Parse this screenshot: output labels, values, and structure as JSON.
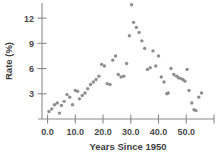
{
  "chart_data": {
    "type": "scatter",
    "title": "",
    "xlabel": "Years Since 1950",
    "ylabel": "Rate (%)",
    "xlim": [
      -2,
      60
    ],
    "ylim": [
      0,
      13.8
    ],
    "grid": false,
    "legend": null,
    "xticks": [
      0.0,
      10.0,
      20.0,
      30.0,
      40.0,
      50.0,
      60.0
    ],
    "xtick_labels": [
      "0.0",
      "10.0",
      "20.0",
      "30.0",
      "40.0",
      "50.0",
      ""
    ],
    "yticks": [
      3,
      6,
      9,
      12
    ],
    "ytick_labels": [
      "3",
      "6",
      "9",
      "12"
    ],
    "marker": "circle",
    "marker_color": "#8d8d93",
    "series": [
      {
        "name": "Rate",
        "x": [
          0.5,
          1.5,
          2.5,
          3.5,
          4.3,
          5.0,
          6.0,
          7.0,
          8.0,
          9.0,
          10.0,
          10.8,
          11.5,
          12.5,
          13.5,
          14.5,
          15.5,
          16.5,
          17.5,
          18.5,
          19.5,
          20.5,
          21.5,
          22.5,
          23.5,
          24.5,
          25.5,
          26.5,
          27.5,
          28.5,
          29.5,
          30.3,
          31.0,
          32.0,
          33.0,
          34.0,
          35.0,
          36.0,
          37.0,
          38.0,
          39.0,
          40.0,
          41.0,
          42.0,
          43.0,
          43.5,
          44.5,
          45.5,
          46.5,
          47.2,
          48.0,
          48.8,
          49.5,
          50.3,
          51.0,
          52.0,
          52.8,
          53.5,
          54.5,
          55.5
        ],
        "y": [
          0.9,
          1.2,
          1.7,
          1.9,
          0.7,
          1.6,
          2.1,
          2.9,
          2.6,
          1.7,
          3.4,
          3.3,
          2.4,
          2.8,
          3.1,
          3.6,
          4.1,
          4.4,
          4.7,
          5.1,
          6.5,
          6.3,
          4.2,
          4.1,
          7.0,
          7.5,
          5.3,
          5.0,
          5.1,
          6.6,
          9.9,
          13.6,
          11.5,
          10.9,
          10.3,
          9.3,
          8.4,
          5.9,
          6.1,
          8.1,
          6.3,
          7.5,
          5.0,
          4.4,
          3.0,
          3.1,
          6.0,
          5.3,
          5.1,
          4.9,
          4.8,
          4.7,
          4.5,
          5.9,
          3.4,
          1.9,
          1.1,
          1.0,
          2.6,
          3.1
        ]
      }
    ]
  }
}
